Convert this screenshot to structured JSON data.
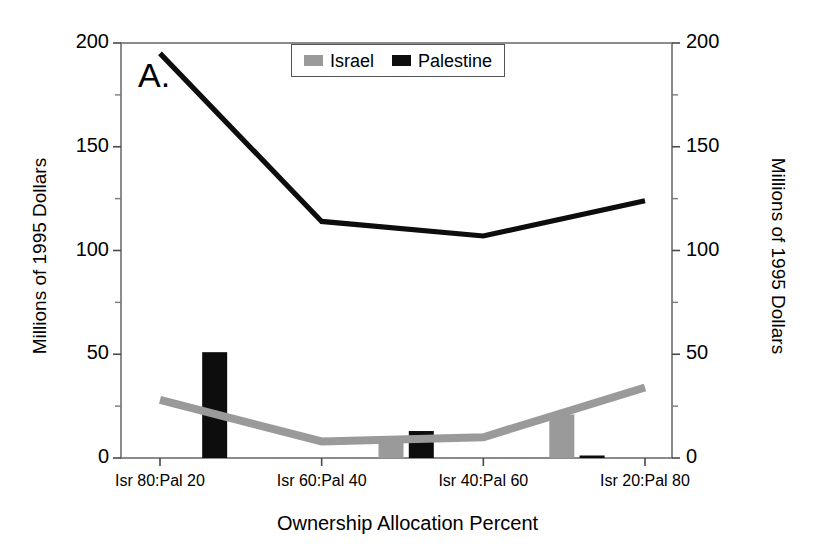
{
  "panel": {
    "label": "A."
  },
  "legend": {
    "entries": [
      {
        "name": "Israel",
        "color": "#9a9a9a"
      },
      {
        "name": "Palestine",
        "color": "#0d0d0d"
      }
    ]
  },
  "axes": {
    "y_left_title": "Millions of 1995 Dollars",
    "y_right_title": "Millions of 1995 Dollars",
    "x_title": "Ownership Allocation Percent",
    "y_ticks": [
      "0",
      "50",
      "100",
      "150",
      "200"
    ],
    "y_ticks_right": [
      "0",
      "50",
      "100",
      "150",
      "200"
    ],
    "x_ticks": [
      "Isr 80:Pal 20",
      "Isr 60:Pal 40",
      "Isr 40:Pal 60",
      "Isr 20:Pal 80"
    ]
  },
  "chart_data": {
    "type": "line",
    "title": "A.",
    "xlabel": "Ownership Allocation Percent",
    "ylabel": "Millions of 1995 Dollars",
    "ylabel_right": "Millions of 1995 Dollars",
    "categories": [
      "Isr 80:Pal 20",
      "Isr 60:Pal 40",
      "Isr 40:Pal 60",
      "Isr 20:Pal 80"
    ],
    "ylim": [
      0,
      200
    ],
    "ytick_values": [
      0,
      50,
      100,
      150,
      200
    ],
    "minor_ytick_values": [
      25,
      75,
      125,
      175
    ],
    "grid": false,
    "legend_position": "top-center",
    "series": [
      {
        "name": "Palestine",
        "type": "line",
        "color": "#0d0d0d",
        "values": [
          195,
          114,
          107,
          124
        ]
      },
      {
        "name": "Israel",
        "type": "line",
        "color": "#9a9a9a",
        "values": [
          28,
          8,
          10,
          34
        ]
      }
    ],
    "bars": [
      {
        "series": "Palestine",
        "color": "#0d0d0d",
        "x_frac": 0.17,
        "value": 51
      },
      {
        "series": "Israel",
        "color": "#9a9a9a",
        "x_frac": 0.49,
        "value": 10
      },
      {
        "series": "Palestine",
        "color": "#0d0d0d",
        "x_frac": 0.545,
        "value": 13
      },
      {
        "series": "Israel",
        "color": "#9a9a9a",
        "x_frac": 0.8,
        "value": 21
      },
      {
        "series": "Palestine",
        "color": "#0d0d0d",
        "x_frac": 0.855,
        "value": 1
      }
    ]
  }
}
